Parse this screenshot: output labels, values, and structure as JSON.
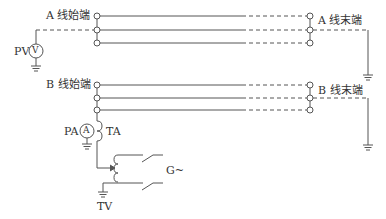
{
  "diagram": {
    "type": "circuit-test-diagram",
    "labels": {
      "a_start": "A 线始端",
      "a_end": "A 线末端",
      "b_start": "B 线始端",
      "b_end": "B 线末端",
      "pv": "PV",
      "voltmeter_symbol": "V",
      "pa": "PA",
      "ammeter_symbol": "A",
      "ta": "TA",
      "tv": "TV",
      "generator": "G~"
    },
    "colors": {
      "line": "#555555",
      "text": "#333333",
      "background": "#ffffff"
    }
  }
}
